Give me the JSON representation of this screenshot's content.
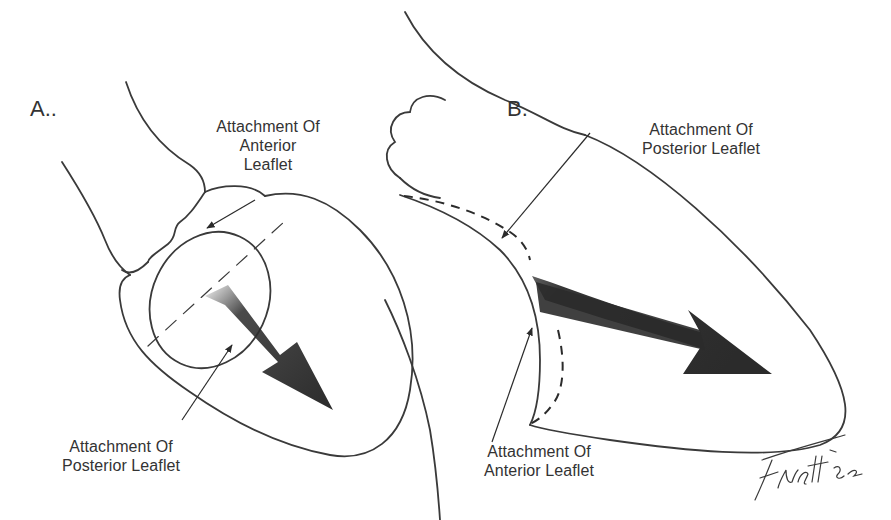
{
  "panels": {
    "a": {
      "letter": "A..",
      "top_label": [
        "Attachment Of",
        "Anterior",
        "Leaflet"
      ],
      "bottom_label": [
        "Attachment Of",
        "Posterior Leaflet"
      ]
    },
    "b": {
      "letter": "B.",
      "top_label": [
        "Attachment Of",
        "Posterior Leaflet"
      ],
      "bottom_label": [
        "Attachment Of",
        "Anterior Leaflet"
      ]
    }
  },
  "signature": "Fwett '82",
  "colors": {
    "line": "#3a3a3a",
    "arrow": "#2b2b2b",
    "text": "#333333"
  }
}
